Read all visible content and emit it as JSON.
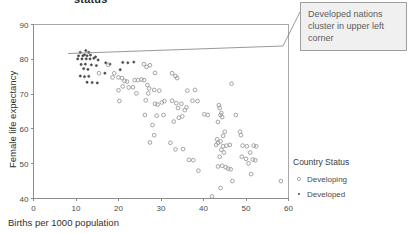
{
  "title_fragment": "status",
  "annotation": {
    "text": "Developed nations cluster in upper left corner",
    "leader_from": [
      283,
      46
    ],
    "leader_to": [
      300,
      12
    ]
  },
  "legend": {
    "title": "Country Status",
    "entries": [
      {
        "label": "Developing",
        "marker": "open-circle",
        "color": "#9a9a9a"
      },
      {
        "label": "Developed",
        "marker": "filled-dot",
        "color": "#4a4a4a"
      }
    ]
  },
  "colors": {
    "developing": "#9a9a9a",
    "developed": "#4a4a4a",
    "axis": "#8c8c8c",
    "frame": "#a8a8a8",
    "callout_fill": "#f0f0f0",
    "callout_border": "#9e9e9e"
  },
  "chart_data": {
    "type": "scatter",
    "title": "status",
    "xlabel": "Births per 1000 population",
    "ylabel": "Female life expectancy",
    "xlim": [
      0,
      60
    ],
    "ylim": [
      40,
      90
    ],
    "xticks": [
      0,
      10,
      20,
      30,
      40,
      50,
      60
    ],
    "yticks": [
      40,
      50,
      60,
      70,
      80,
      90
    ],
    "grid": false,
    "legend_position": "right",
    "annotations": [
      {
        "text": "Developed nations cluster in upper left corner",
        "points_to": [
          13,
          82
        ]
      }
    ],
    "series": [
      {
        "name": "Developed",
        "marker": "filled-dot",
        "color": "#4a4a4a",
        "points": [
          [
            11.0,
            82.0
          ],
          [
            12.3,
            82.5
          ],
          [
            13.0,
            82.0
          ],
          [
            12.0,
            81.3
          ],
          [
            10.6,
            81.0
          ],
          [
            11.6,
            81.0
          ],
          [
            12.6,
            81.0
          ],
          [
            13.4,
            81.2
          ],
          [
            14.6,
            80.7
          ],
          [
            10.4,
            80.1
          ],
          [
            11.4,
            80.1
          ],
          [
            12.4,
            80.1
          ],
          [
            13.3,
            80.1
          ],
          [
            14.2,
            80.3
          ],
          [
            15.2,
            79.8
          ],
          [
            11.2,
            78.5
          ],
          [
            12.2,
            78.6
          ],
          [
            13.6,
            78.4
          ],
          [
            14.8,
            78.2
          ],
          [
            11.8,
            77.3
          ],
          [
            12.8,
            77.1
          ],
          [
            11.0,
            75.2
          ],
          [
            12.0,
            75.0
          ],
          [
            13.0,
            75.1
          ],
          [
            12.6,
            73.4
          ],
          [
            13.8,
            73.3
          ],
          [
            15.0,
            73.2
          ],
          [
            17.0,
            79.0
          ],
          [
            18.0,
            78.6
          ],
          [
            21.0,
            79.1
          ],
          [
            22.2,
            79.0
          ],
          [
            20.4,
            77.0
          ],
          [
            23.6,
            79.2
          ],
          [
            16.8,
            76.0
          ]
        ]
      },
      {
        "name": "Developing",
        "marker": "open-circle",
        "color": "#9a9a9a",
        "points": [
          [
            17.6,
            78.4
          ],
          [
            19.0,
            76.0
          ],
          [
            20.0,
            74.8
          ],
          [
            20.8,
            74.6
          ],
          [
            21.4,
            73.8
          ],
          [
            22.0,
            73.6
          ],
          [
            21.0,
            72.2
          ],
          [
            22.4,
            71.9
          ],
          [
            23.4,
            72.0
          ],
          [
            23.8,
            74.0
          ],
          [
            24.6,
            74.0
          ],
          [
            25.4,
            74.2
          ],
          [
            20.0,
            71.1
          ],
          [
            20.2,
            68.0
          ],
          [
            26.0,
            78.6
          ],
          [
            26.6,
            77.8
          ],
          [
            27.4,
            78.3
          ],
          [
            28.6,
            76.1
          ],
          [
            26.0,
            74.0
          ],
          [
            26.8,
            72.6
          ],
          [
            27.2,
            71.6
          ],
          [
            27.0,
            70.2
          ],
          [
            28.4,
            71.2
          ],
          [
            29.6,
            71.0
          ],
          [
            26.4,
            68.2
          ],
          [
            28.6,
            67.2
          ],
          [
            29.2,
            67.0
          ],
          [
            30.2,
            67.6
          ],
          [
            30.8,
            68.0
          ],
          [
            26.2,
            64.0
          ],
          [
            28.0,
            61.1
          ],
          [
            28.4,
            58.2
          ],
          [
            27.4,
            56.1
          ],
          [
            32.6,
            76.0
          ],
          [
            33.4,
            75.2
          ],
          [
            33.8,
            74.6
          ],
          [
            32.6,
            68.1
          ],
          [
            33.6,
            67.4
          ],
          [
            34.8,
            67.2
          ],
          [
            34.0,
            66.0
          ],
          [
            33.0,
            62.1
          ],
          [
            34.2,
            63.2
          ],
          [
            35.0,
            63.6
          ],
          [
            35.6,
            65.4
          ],
          [
            36.0,
            66.2
          ],
          [
            32.2,
            56.0
          ],
          [
            33.4,
            54.1
          ],
          [
            36.2,
            71.0
          ],
          [
            38.0,
            71.2
          ],
          [
            37.4,
            68.1
          ],
          [
            38.6,
            68.0
          ],
          [
            36.6,
            51.1
          ],
          [
            37.6,
            51.0
          ],
          [
            38.8,
            48.0
          ],
          [
            41.0,
            64.0
          ],
          [
            40.2,
            64.2
          ],
          [
            42.0,
            40.6
          ],
          [
            43.6,
            66.8
          ],
          [
            43.8,
            66.0
          ],
          [
            44.2,
            64.6
          ],
          [
            44.0,
            64.0
          ],
          [
            44.4,
            63.4
          ],
          [
            43.4,
            62.0
          ],
          [
            45.0,
            59.2
          ],
          [
            44.6,
            58.0
          ],
          [
            43.2,
            57.0
          ],
          [
            44.0,
            56.4
          ],
          [
            43.4,
            56.0
          ],
          [
            43.0,
            55.4
          ],
          [
            44.6,
            55.0
          ],
          [
            45.4,
            55.2
          ],
          [
            46.2,
            55.4
          ],
          [
            44.2,
            54.0
          ],
          [
            44.8,
            53.2
          ],
          [
            43.8,
            52.0
          ],
          [
            43.4,
            49.2
          ],
          [
            44.4,
            49.4
          ],
          [
            45.2,
            49.0
          ],
          [
            45.8,
            48.6
          ],
          [
            46.4,
            48.4
          ],
          [
            46.8,
            45.0
          ],
          [
            44.0,
            43.0
          ],
          [
            46.6,
            73.0
          ],
          [
            47.6,
            64.0
          ],
          [
            48.6,
            59.2
          ],
          [
            48.8,
            58.2
          ],
          [
            49.2,
            55.2
          ],
          [
            50.2,
            55.0
          ],
          [
            51.8,
            55.2
          ],
          [
            52.4,
            55.0
          ],
          [
            49.0,
            52.0
          ],
          [
            50.0,
            51.4
          ],
          [
            51.0,
            53.2
          ],
          [
            51.6,
            51.2
          ],
          [
            52.2,
            51.0
          ],
          [
            50.6,
            50.1
          ],
          [
            51.2,
            47.0
          ],
          [
            58.2,
            45.0
          ],
          [
            15.4,
            76.0
          ],
          [
            18.6,
            74.8
          ],
          [
            24.2,
            70.2
          ],
          [
            29.0,
            63.8
          ],
          [
            30.6,
            64.0
          ],
          [
            35.2,
            54.2
          ]
        ]
      }
    ]
  }
}
